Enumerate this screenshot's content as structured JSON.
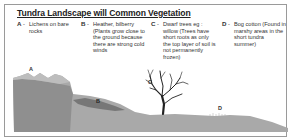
{
  "title": "Tundra Landscape will Common Vegetation",
  "key": [
    {
      "letter": "A",
      "text": "Lichens on bare rocks"
    },
    {
      "letter": "B",
      "text": "Heather, bilberry (Plants grow close to the ground because there are strong cold winds"
    },
    {
      "letter": "C",
      "text": "Dwarf trees eg : willow (Trees have short roots as only the top layer of soil is not permanently frozen)"
    },
    {
      "letter": "D",
      "text": "Bog cotton (Found in marshy areas in the short tundra summer)"
    }
  ],
  "diagram_labels": {
    "a": "A",
    "b": "B",
    "c": "C",
    "d": "D"
  },
  "dash": "-"
}
